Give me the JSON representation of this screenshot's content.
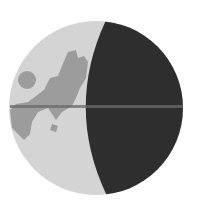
{
  "icon": {
    "name": "globe-crescent-icon",
    "colors": {
      "background": "#ffffff",
      "lit": "#d4d4d4",
      "land": "#9c9c9c",
      "shadow": "#2e2e2e",
      "equator_line": "#6a6a6a"
    }
  }
}
